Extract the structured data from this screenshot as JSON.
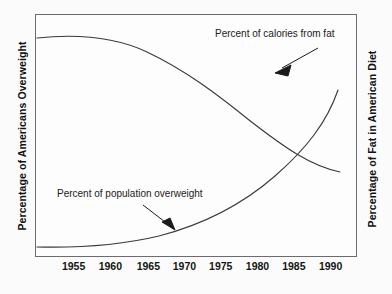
{
  "chart_data": {
    "type": "line",
    "title": "",
    "xlabel": "",
    "ylabel": "Percentage of Americans Overweight",
    "ylabel_right": "Percentage of Fat in American Diet",
    "grid": false,
    "legend_position": "inline-annotations",
    "xlim": [
      1952,
      1992
    ],
    "xticks": [
      1955,
      1960,
      1965,
      1970,
      1975,
      1980,
      1985,
      1990
    ],
    "xtick_labels": [
      "1955",
      "1960",
      "1965",
      "1970",
      "1975",
      "1980",
      "1985",
      "1990"
    ],
    "series": [
      {
        "name": "Percent of calories from fat",
        "axis": "right",
        "annotation": "Percent of calories from fat",
        "x": [
          1952,
          1955,
          1958,
          1961,
          1964,
          1967,
          1970,
          1973,
          1976,
          1979,
          1982,
          1985,
          1988,
          1991
        ],
        "y": [
          90,
          91,
          91,
          89,
          86,
          82,
          77,
          71,
          65,
          58,
          50,
          42,
          33,
          25
        ]
      },
      {
        "name": "Percent of population overweight",
        "axis": "left",
        "annotation": "Percent of population overweight",
        "x": [
          1952,
          1955,
          1958,
          1961,
          1964,
          1967,
          1970,
          1973,
          1976,
          1979,
          1982,
          1985,
          1988,
          1991
        ],
        "y": [
          4,
          4,
          4,
          5,
          7,
          9,
          12,
          16,
          21,
          28,
          37,
          48,
          62,
          78
        ]
      }
    ],
    "crossing_point": {
      "x": 1989,
      "note": "curves intersect near 1989"
    }
  },
  "axes": {
    "left_title": "Percentage of Americans Overweight",
    "right_title": "Percentage of Fat in American Diet"
  },
  "xticks": [
    {
      "label": "1955",
      "pos_pct": 12.0
    },
    {
      "label": "1960",
      "pos_pct": 23.4
    },
    {
      "label": "1965",
      "pos_pct": 35.2
    },
    {
      "label": "1970",
      "pos_pct": 46.4
    },
    {
      "label": "1975",
      "pos_pct": 57.7
    },
    {
      "label": "1980",
      "pos_pct": 69.1
    },
    {
      "label": "1985",
      "pos_pct": 80.4
    },
    {
      "label": "1990",
      "pos_pct": 91.8
    }
  ],
  "annotations": {
    "fat_label": "Percent of calories from fat",
    "overweight_label": "Percent of population overweight"
  },
  "colors": {
    "frame": "#6b6b70",
    "curve": "#3a3a3e",
    "text": "#111111",
    "plot_background": "#fdfdfd",
    "page_background": "#fbfbfb"
  }
}
